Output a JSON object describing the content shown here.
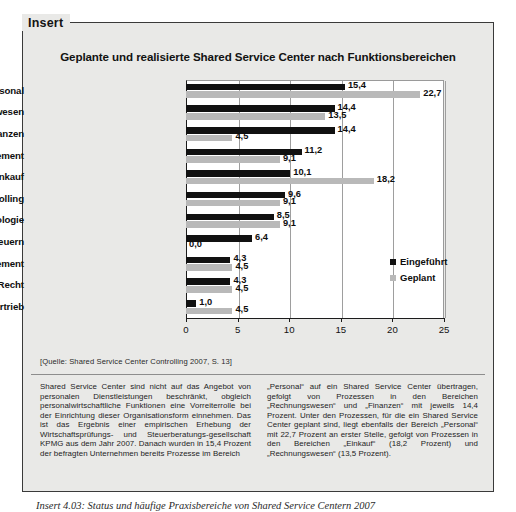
{
  "insert": {
    "tab_label": "Insert"
  },
  "chart_data": {
    "type": "bar",
    "orientation": "horizontal",
    "title": "Geplante und realisierte Shared Service Center nach Funktionsbereichen",
    "xlabel": "",
    "ylabel": "",
    "xlim": [
      0,
      25
    ],
    "xticks": [
      "0",
      "5",
      "10",
      "15",
      "20",
      "25"
    ],
    "grid": true,
    "legend_position": "inside-right",
    "categories": [
      "Personal",
      "Rechnungswesen",
      "Finanzen",
      "Reisemanagement",
      "Einkauf",
      "Controlling",
      "Informationstechnologie",
      "Steuern",
      "Facility Management",
      "Recht",
      "Marketing/Vertrieb"
    ],
    "series": [
      {
        "name": "Eingeführt",
        "color": "#111111",
        "values": [
          15.4,
          14.4,
          14.4,
          11.2,
          10.1,
          9.6,
          8.5,
          6.4,
          4.3,
          4.3,
          1.0
        ],
        "labels": [
          "15,4",
          "14,4",
          "14,4",
          "11,2",
          "10,1",
          "9,6",
          "8,5",
          "6,4",
          "4,3",
          "4,3",
          "1,0"
        ]
      },
      {
        "name": "Geplant",
        "color": "#b9b9b9",
        "values": [
          22.7,
          13.5,
          4.5,
          9.1,
          18.2,
          9.1,
          9.1,
          0.0,
          4.5,
          4.5,
          4.5
        ],
        "labels": [
          "22,7",
          "13,5",
          "4,5",
          "9,1",
          "18,2",
          "9,1",
          "9,1",
          "0,0",
          "4,5",
          "4,5",
          "4,5"
        ]
      }
    ]
  },
  "source_note": "[Quelle: Shared Service Center Controlling 2007, S. 13]",
  "body": {
    "left_column": "Shared Service Center sind nicht auf das Angebot von personalen Dienstleistungen beschränkt, obgleich personalwirtschaftliche Funktionen eine Vorreiterrolle bei der Einrichtung dieser Organisationsform einnehmen. Das ist das Ergebnis einer empirischen Erhebung der Wirtschaftsprüfungs- und Steuerberatungs-gesellschaft KPMG aus dem Jahr 2007. Danach wurden in 15,4 Prozent der befragten Unternehmen bereits Prozesse im Bereich",
    "right_column": "„Personal“ auf ein Shared Service Center übertragen, gefolgt von Prozessen in den Bereichen „Rechnungswesen“ und „Finanzen“ mit jeweils 14,4 Prozent. Unter den Prozessen, für die ein Shared Service Center geplant sind, liegt ebenfalls der Bereich „Personal“ mit 22,7 Prozent an erster Stelle, gefolgt von Prozessen in den Bereichen „Einkauf“ (18,2 Prozent) und „Rechnungswesen“ (13,5 Prozent)."
  },
  "caption": "Insert 4.03: Status und häufige Praxisbereiche von Shared Service Centern 2007"
}
